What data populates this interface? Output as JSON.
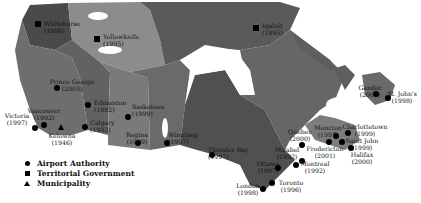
{
  "colors": {
    "background": "#ffffff",
    "yukon": "#4a4a4a",
    "nwt": "#8c8c8c",
    "nunavut": "#5a5a5a",
    "bc": "#6e6e6e",
    "alberta": "#626262",
    "saskatchewan": "#7a7a7a",
    "manitoba": "#6a6a6a",
    "ontario": "#505050",
    "quebec": "#666666",
    "labrador": "#5e5e5e",
    "maritimes": "#7c7c7c",
    "water": "#ffffff",
    "marker": "#000000"
  },
  "legend": {
    "items": [
      {
        "symbol": "circle",
        "label": "Airport Authority"
      },
      {
        "symbol": "square",
        "label": "Territorial Government"
      },
      {
        "symbol": "triangle",
        "label": "Municipality"
      }
    ]
  },
  "locations": [
    {
      "name": "Whitehorse",
      "year": "(1996)",
      "type": "square"
    },
    {
      "name": "Yellowknife",
      "year": "(1995)",
      "type": "square"
    },
    {
      "name": "Iqaluit",
      "year": "(1995)",
      "type": "square"
    },
    {
      "name": "Prince George",
      "year": "(2003)",
      "type": "circle"
    },
    {
      "name": "Edmonton",
      "year": "(1992)",
      "type": "circle"
    },
    {
      "name": "Saskatoon",
      "year": "(1999)",
      "type": "circle"
    },
    {
      "name": "Vancouver",
      "year": "(1992)",
      "type": "circle"
    },
    {
      "name": "Victoria",
      "year": "(1997)",
      "type": "circle"
    },
    {
      "name": "Calgary",
      "year": "(1992)",
      "type": "circle"
    },
    {
      "name": "Kelowna",
      "year": "(1946)",
      "type": "triangle"
    },
    {
      "name": "Regina",
      "year": "(1999)",
      "type": "circle"
    },
    {
      "name": "Winnipeg",
      "year": "(1997)",
      "type": "circle"
    },
    {
      "name": "Thunder Bay",
      "year": "(1997)",
      "type": "circle"
    },
    {
      "name": "Ottawa",
      "year": "(1997)",
      "type": "circle"
    },
    {
      "name": "London",
      "year": "(1998)",
      "type": "circle"
    },
    {
      "name": "Toronto",
      "year": "(1996)",
      "type": "circle"
    },
    {
      "name": "Mirabel",
      "year": "(1992)",
      "type": "circle"
    },
    {
      "name": "Montreal",
      "year": "(1992)",
      "type": "circle"
    },
    {
      "name": "Quebec",
      "year": "(2000)",
      "type": "circle"
    },
    {
      "name": "Moncton",
      "year": "(1997)",
      "type": "circle"
    },
    {
      "name": "Fredericton",
      "year": "(2001)",
      "type": "circle"
    },
    {
      "name": "Charlottetown",
      "year": "(1999)",
      "type": "circle"
    },
    {
      "name": "Saint John",
      "year": "(1999)",
      "type": "circle"
    },
    {
      "name": "Halifax",
      "year": "(2000)",
      "type": "circle"
    },
    {
      "name": "Gander",
      "year": "(2001)",
      "type": "circle"
    },
    {
      "name": "St. John's",
      "year": "(1998)",
      "type": "circle"
    }
  ]
}
